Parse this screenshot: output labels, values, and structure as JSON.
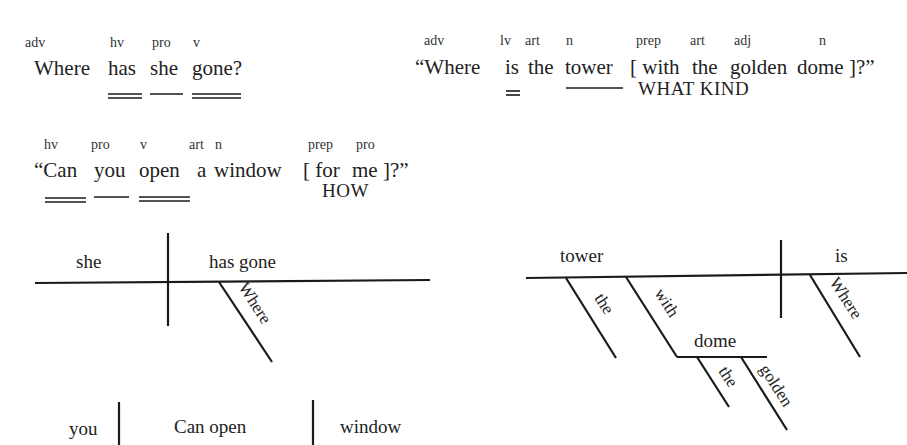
{
  "sentences": [
    {
      "id": "s1",
      "pos_labels": [
        "adv",
        "hv",
        "pro",
        "v"
      ],
      "words": [
        "Where",
        "has",
        "she",
        "gone?"
      ],
      "underline_styles": [
        "none",
        "double",
        "single",
        "double"
      ]
    },
    {
      "id": "s2",
      "pos_labels": [
        "adv",
        "lv",
        "art",
        "n",
        "prep",
        "art",
        "adj",
        "n"
      ],
      "words": [
        "“Where",
        "is",
        "the",
        "tower",
        "[ with",
        "the",
        "golden",
        "dome ]?”"
      ],
      "underline_styles": [
        "none",
        "double",
        "none",
        "single",
        "none",
        "none",
        "none",
        "none"
      ],
      "note": "WHAT KIND"
    },
    {
      "id": "s3",
      "pos_labels": [
        "hv",
        "pro",
        "v",
        "art",
        "n",
        "prep",
        "pro"
      ],
      "words": [
        "“Can",
        "you",
        "open",
        "a",
        "window",
        "[ for",
        "me ]?”"
      ],
      "underline_styles": [
        "double",
        "single",
        "double",
        "none",
        "none",
        "none",
        "none"
      ],
      "note": "HOW"
    }
  ],
  "diagrams": {
    "d1": {
      "subject": "she",
      "verb": "has gone",
      "modifiers": [
        "Where"
      ]
    },
    "d2": {
      "subject": "tower",
      "verb": "is",
      "subject_modifiers": [
        "the",
        "with"
      ],
      "object_of_prep": "dome",
      "prep_object_modifiers": [
        "the",
        "golden"
      ],
      "verb_modifiers": [
        "Where"
      ]
    },
    "d3": {
      "subject": "you",
      "verb": "Can open",
      "object": "window"
    }
  }
}
